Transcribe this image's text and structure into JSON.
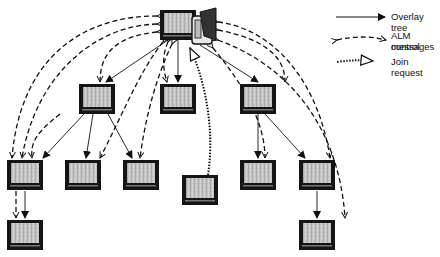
{
  "legend": {
    "overlay_tree": "Overlay tree",
    "alm_control_1": "ALM control",
    "alm_control_2": "messages",
    "join_request": "Join request"
  },
  "nodes": [
    {
      "id": "root",
      "x": 160,
      "y": 10,
      "role": "source"
    },
    {
      "id": "l1a",
      "x": 79,
      "y": 84
    },
    {
      "id": "l1b",
      "x": 160,
      "y": 84
    },
    {
      "id": "l1c",
      "x": 240,
      "y": 84
    },
    {
      "id": "l2a",
      "x": 7,
      "y": 160
    },
    {
      "id": "l2b",
      "x": 65,
      "y": 160
    },
    {
      "id": "l2c",
      "x": 123,
      "y": 160
    },
    {
      "id": "l2d",
      "x": 240,
      "y": 160
    },
    {
      "id": "l2e",
      "x": 299,
      "y": 160
    },
    {
      "id": "join",
      "x": 182,
      "y": 175,
      "role": "joining"
    },
    {
      "id": "l3a",
      "x": 7,
      "y": 220
    },
    {
      "id": "l3b",
      "x": 299,
      "y": 220
    }
  ],
  "colors": {
    "line": "#111111",
    "screen": "#bdbdbd",
    "frame": "#1a1a1a"
  }
}
